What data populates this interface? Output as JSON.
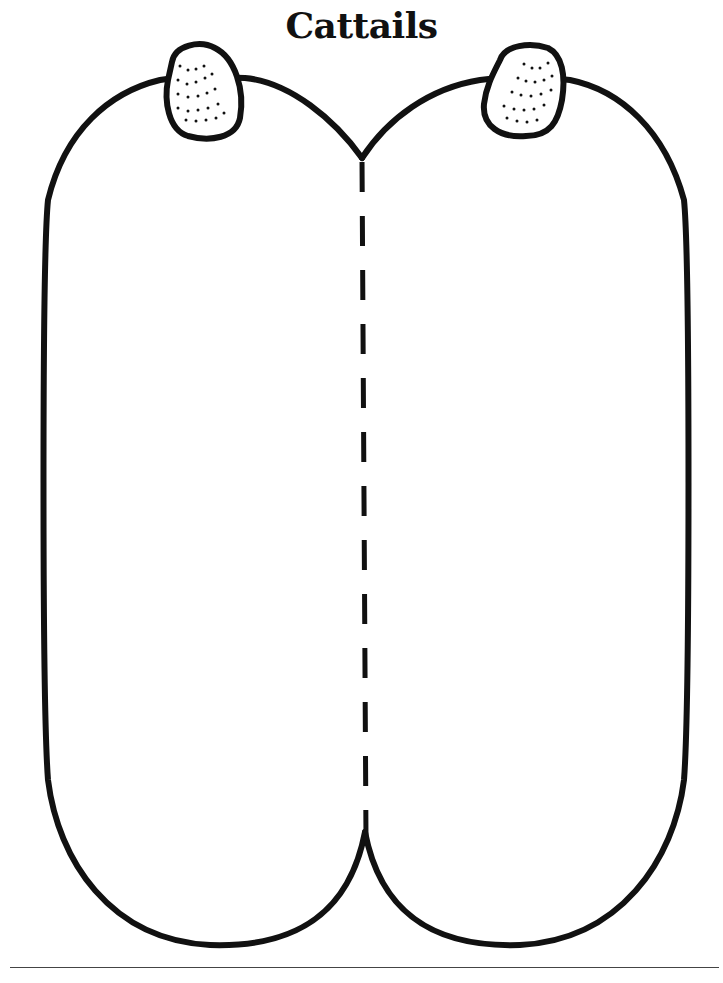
{
  "page": {
    "title": "Cattails"
  },
  "colors": {
    "ink": "#111111",
    "paper": "#ffffff",
    "rule": "#444444"
  },
  "elements": {
    "left_panel": "left-cattail-panel",
    "right_panel": "right-cattail-panel",
    "fold_line": "dashed-fold-line",
    "left_head": "left-cattail-head",
    "right_head": "right-cattail-head"
  }
}
